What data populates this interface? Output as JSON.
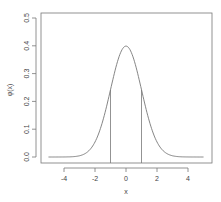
{
  "chart_data": {
    "type": "line",
    "title": "",
    "xlabel": "x",
    "ylabel": "φ(x)",
    "xlim": [
      -5.3,
      5.3
    ],
    "ylim": [
      0,
      0.5
    ],
    "x_ticks": [
      -4,
      -2,
      0,
      2,
      4
    ],
    "x_tick_labels": [
      "-4",
      "-2",
      "0",
      "2",
      "4"
    ],
    "y_ticks": [
      0.0,
      0.1,
      0.2,
      0.3,
      0.4,
      0.5
    ],
    "y_tick_labels": [
      "0.0",
      "0.1",
      "0.2",
      "0.3",
      "0.4",
      "0.5"
    ],
    "grid": false,
    "legend": null,
    "series": [
      {
        "name": "standard normal density",
        "function": "dnorm",
        "x_range": [
          -5,
          5
        ],
        "x": [
          -5,
          -4,
          -3,
          -2,
          -1.5,
          -1,
          -0.5,
          0,
          0.5,
          1,
          1.5,
          2,
          3,
          4,
          5
        ],
        "y": [
          0.0,
          0.0001,
          0.0044,
          0.054,
          0.1295,
          0.242,
          0.3521,
          0.3989,
          0.3521,
          0.242,
          0.1295,
          0.054,
          0.0044,
          0.0001,
          0.0
        ]
      }
    ],
    "annotations": [
      {
        "type": "vertical-segment",
        "x": -1,
        "y_from": 0,
        "y_to": 0.242
      },
      {
        "type": "vertical-segment",
        "x": 1,
        "y_from": 0,
        "y_to": 0.242
      }
    ],
    "colors": {
      "line": "#777777",
      "axis": "#777777",
      "text": "#444444"
    }
  }
}
